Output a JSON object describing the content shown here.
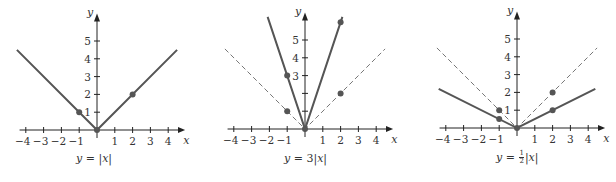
{
  "chart_data": [
    {
      "type": "line",
      "title": "y = |x|",
      "xlabel": "x",
      "ylabel": "y",
      "xlim": [
        -4.5,
        4.8
      ],
      "ylim": [
        0,
        6
      ],
      "x_ticks": [
        -4,
        -3,
        -2,
        -1,
        1,
        2,
        3,
        4
      ],
      "y_ticks": [
        1,
        2,
        3,
        4,
        5
      ],
      "series": [
        {
          "name": "y = |x|",
          "style": "solid",
          "points": [
            [
              -4.5,
              4.5
            ],
            [
              0,
              0
            ],
            [
              4.5,
              4.5
            ]
          ]
        }
      ],
      "markers": [
        [
          -1,
          1
        ],
        [
          0,
          0
        ],
        [
          2,
          2
        ]
      ]
    },
    {
      "type": "line",
      "title": "y = 3|x|",
      "xlabel": "x",
      "ylabel": "y",
      "xlim": [
        -4.5,
        4.8
      ],
      "ylim": [
        0,
        6
      ],
      "x_ticks": [
        -4,
        -3,
        -2,
        -1,
        1,
        2,
        3,
        4
      ],
      "y_ticks": [
        3,
        4,
        5
      ],
      "series": [
        {
          "name": "y = 3|x|",
          "style": "solid",
          "points": [
            [
              -2.1,
              6.3
            ],
            [
              0,
              0
            ],
            [
              2.1,
              6.3
            ]
          ]
        },
        {
          "name": "y = |x|",
          "style": "dashed",
          "points": [
            [
              -4.5,
              4.5
            ],
            [
              0,
              0
            ],
            [
              4.5,
              4.5
            ]
          ]
        }
      ],
      "markers": [
        [
          -1,
          3
        ],
        [
          -1,
          1
        ],
        [
          0,
          0
        ],
        [
          2,
          2
        ],
        [
          2,
          6
        ]
      ]
    },
    {
      "type": "line",
      "title": "y = 1/2|x|",
      "xlabel": "x",
      "ylabel": "y",
      "xlim": [
        -4.5,
        4.8
      ],
      "ylim": [
        0,
        6
      ],
      "x_ticks": [
        -4,
        -3,
        -2,
        -1,
        1,
        2,
        3,
        4
      ],
      "y_ticks": [
        1,
        2,
        3,
        4,
        5
      ],
      "series": [
        {
          "name": "y = 1/2|x|",
          "style": "solid",
          "points": [
            [
              -4.4,
              2.2
            ],
            [
              0,
              0
            ],
            [
              4.4,
              2.2
            ]
          ]
        },
        {
          "name": "y = |x|",
          "style": "dashed",
          "points": [
            [
              -4.5,
              4.5
            ],
            [
              0,
              0
            ],
            [
              4.5,
              4.5
            ]
          ]
        }
      ],
      "markers": [
        [
          -1,
          1
        ],
        [
          -1,
          0.5
        ],
        [
          0,
          0
        ],
        [
          2,
          2
        ],
        [
          2,
          1
        ]
      ]
    }
  ],
  "captions": {
    "p1": {
      "lhs": "y",
      "eq": " = ",
      "rhs": "|x|"
    },
    "p2": {
      "lhs": "y",
      "eq": " = 3",
      "rhs": "|x|"
    },
    "p3": {
      "lhs": "y",
      "eq": " = ",
      "num": "1",
      "den": "2",
      "rhs": "|x|"
    }
  },
  "axis_labels": {
    "x": "x",
    "y": "y"
  },
  "colors": {
    "curve": "#555555",
    "axis": "#222222",
    "dashed": "#777777",
    "marker": "#555555"
  }
}
